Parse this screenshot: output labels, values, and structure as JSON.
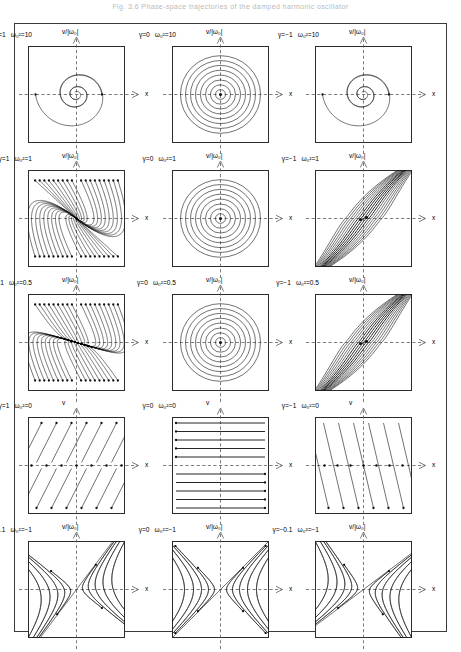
{
  "header": {
    "caption": "Fig. 3.6 Phase-space trajectories of the damped harmonic oscillator"
  },
  "figure": {
    "axis_x_label": "x",
    "axis_y_label_scaled": "v/|ω₀|",
    "axis_y_label_plain": "v",
    "columns": 3,
    "rows": 5
  },
  "chart_data": {
    "type": "line",
    "xlabel": "x",
    "ylabel": "v/|ω₀|",
    "xlim": [
      -1,
      1
    ],
    "ylim": [
      -1,
      1
    ],
    "grid": false,
    "legend": "none",
    "panel_grid": {
      "rows": 5,
      "cols": 3
    },
    "parameters": {
      "gamma_by_column": [
        [
          "1",
          "0",
          "-1"
        ],
        [
          "1",
          "0",
          "-1"
        ],
        [
          "1",
          "0",
          "-1"
        ],
        [
          "1",
          "0",
          "-1"
        ],
        [
          "0.1",
          "0",
          "-0.1"
        ]
      ],
      "omega0_squared_by_row": [
        "10",
        "1",
        "0.5",
        "0",
        "-1"
      ]
    },
    "panels": [
      {
        "row": 1,
        "col": 1,
        "gamma_label": "γ=1",
        "omega_label": "ω₀²=10",
        "gamma": 1,
        "omega0_squared": 10,
        "ylabel": "v/|ω₀|",
        "xlabel": "x",
        "regime": "underdamped",
        "fixed_point": "stable spiral",
        "description": "Inward spiral converging to origin"
      },
      {
        "row": 1,
        "col": 2,
        "gamma_label": "γ=0",
        "omega_label": "ω₀²=10",
        "gamma": 0,
        "omega0_squared": 10,
        "ylabel": "v/|ω₀|",
        "xlabel": "x",
        "regime": "undamped",
        "fixed_point": "center",
        "description": "Family of closed concentric circular orbits"
      },
      {
        "row": 1,
        "col": 3,
        "gamma_label": "γ=−1",
        "omega_label": "ω₀²=10",
        "gamma": -1,
        "omega0_squared": 10,
        "ylabel": "v/|ω₀|",
        "xlabel": "x",
        "regime": "negatively damped",
        "fixed_point": "unstable spiral",
        "description": "Outward spiral diverging from origin"
      },
      {
        "row": 2,
        "col": 1,
        "gamma_label": "γ=1",
        "omega_label": "ω₀²=1",
        "gamma": 1,
        "omega0_squared": 1,
        "ylabel": "v/|ω₀|",
        "xlabel": "x",
        "regime": "critically damped",
        "fixed_point": "stable node",
        "description": "Trajectories fall into the origin along a common tangent"
      },
      {
        "row": 2,
        "col": 2,
        "gamma_label": "γ=0",
        "omega_label": "ω₀²=1",
        "gamma": 0,
        "omega0_squared": 1,
        "ylabel": "v/|ω₀|",
        "xlabel": "x",
        "regime": "undamped",
        "fixed_point": "center",
        "description": "Closed concentric circular orbits"
      },
      {
        "row": 2,
        "col": 3,
        "gamma_label": "γ=−1",
        "omega_label": "ω₀²=1",
        "gamma": -1,
        "omega0_squared": 1,
        "ylabel": "v/|ω₀|",
        "xlabel": "x",
        "regime": "critically anti-damped",
        "fixed_point": "unstable node",
        "description": "Trajectories leave the origin along a common tangent"
      },
      {
        "row": 3,
        "col": 1,
        "gamma_label": "γ=1",
        "omega_label": "ω₀²=0.5",
        "gamma": 1,
        "omega0_squared": 0.5,
        "ylabel": "v/|ω₀|",
        "xlabel": "x",
        "regime": "overdamped",
        "fixed_point": "stable node",
        "description": "Two distinct real eigendirections, inward flow"
      },
      {
        "row": 3,
        "col": 2,
        "gamma_label": "γ=0",
        "omega_label": "ω₀²=0.5",
        "gamma": 0,
        "omega0_squared": 0.5,
        "ylabel": "v/|ω₀|",
        "xlabel": "x",
        "regime": "undamped",
        "fixed_point": "center",
        "description": "Closed concentric circular orbits"
      },
      {
        "row": 3,
        "col": 3,
        "gamma_label": "γ=−1",
        "omega_label": "ω₀²=0.5",
        "gamma": -1,
        "omega0_squared": 0.5,
        "ylabel": "v/|ω₀|",
        "xlabel": "x",
        "regime": "over anti-damped",
        "fixed_point": "unstable node",
        "description": "Steep near-parallel outgoing trajectory bundle"
      },
      {
        "row": 4,
        "col": 1,
        "gamma_label": "γ=1",
        "omega_label": "ω₀²=0",
        "gamma": 1,
        "omega0_squared": 0,
        "ylabel": "v",
        "xlabel": "x",
        "regime": "pure damping",
        "fixed_point": "line of fixed points on x-axis",
        "description": "Straight slanted trajectories ending on the x-axis"
      },
      {
        "row": 4,
        "col": 2,
        "gamma_label": "γ=0",
        "omega_label": "ω₀²=0",
        "gamma": 0,
        "omega0_squared": 0,
        "ylabel": "v",
        "xlabel": "x",
        "regime": "free particle",
        "fixed_point": "line of fixed points on x-axis",
        "description": "Horizontal straight lines of constant velocity"
      },
      {
        "row": 4,
        "col": 3,
        "gamma_label": "γ=−1",
        "omega_label": "ω₀²=0",
        "gamma": -1,
        "omega0_squared": 0,
        "ylabel": "v",
        "xlabel": "x",
        "regime": "pure anti-damping",
        "fixed_point": "line of fixed points on x-axis",
        "description": "Straight slanted trajectories leaving the x-axis"
      },
      {
        "row": 5,
        "col": 1,
        "gamma_label": "γ=0.1",
        "omega_label": "ω₀²=−1",
        "gamma": 0.1,
        "omega0_squared": -1,
        "ylabel": "v/|ω₀|",
        "xlabel": "x",
        "regime": "inverted oscillator, weak damping",
        "fixed_point": "saddle",
        "description": "Hyperbolic trajectories, separatrices tilted by damping"
      },
      {
        "row": 5,
        "col": 2,
        "gamma_label": "γ=0",
        "omega_label": "ω₀²=−1",
        "gamma": 0,
        "omega0_squared": -1,
        "ylabel": "v/|ω₀|",
        "xlabel": "x",
        "regime": "inverted oscillator, undamped",
        "fixed_point": "saddle",
        "description": "Symmetric hyperbolae with diagonal separatrices"
      },
      {
        "row": 5,
        "col": 3,
        "gamma_label": "γ=−0.1",
        "omega_label": "ω₀²=−1",
        "gamma": -0.1,
        "omega0_squared": -1,
        "ylabel": "v/|ω₀|",
        "xlabel": "x",
        "regime": "inverted oscillator, weak anti-damping",
        "fixed_point": "saddle",
        "description": "Hyperbolic trajectories tilted opposite to panel 13"
      }
    ]
  }
}
